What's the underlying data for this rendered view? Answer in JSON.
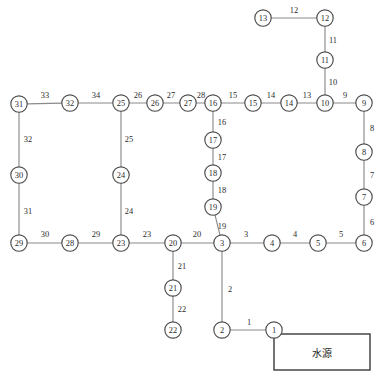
{
  "diagram": {
    "node_radius": 8.2,
    "colors": {
      "edge": "#8a8a8a",
      "node_stroke": "#4a4a4a",
      "node_fill": "#ffffff",
      "text": "#2b2b2b",
      "box_stroke": "#3a3a3a",
      "background": "#ffffff"
    },
    "source_box": {
      "label": "水源",
      "x": 274,
      "y": 334,
      "width": 96,
      "height": 36
    },
    "nodes": [
      {
        "id": "1",
        "label": "1",
        "x": 274,
        "y": 330
      },
      {
        "id": "2",
        "label": "2",
        "x": 222,
        "y": 330
      },
      {
        "id": "3",
        "label": "3",
        "x": 222,
        "y": 243
      },
      {
        "id": "4",
        "label": "4",
        "x": 272,
        "y": 243
      },
      {
        "id": "5",
        "label": "5",
        "x": 318,
        "y": 243
      },
      {
        "id": "6",
        "label": "6",
        "x": 364,
        "y": 243
      },
      {
        "id": "7",
        "label": "7",
        "x": 364,
        "y": 197
      },
      {
        "id": "8",
        "label": "8",
        "x": 364,
        "y": 152
      },
      {
        "id": "9",
        "label": "9",
        "x": 364,
        "y": 103
      },
      {
        "id": "10",
        "label": "10",
        "x": 325,
        "y": 103
      },
      {
        "id": "11",
        "label": "11",
        "x": 325,
        "y": 60
      },
      {
        "id": "12",
        "label": "12",
        "x": 325,
        "y": 18
      },
      {
        "id": "13",
        "label": "13",
        "x": 263,
        "y": 18
      },
      {
        "id": "14",
        "label": "14",
        "x": 289,
        "y": 103
      },
      {
        "id": "15",
        "label": "15",
        "x": 253,
        "y": 103
      },
      {
        "id": "16",
        "label": "16",
        "x": 213,
        "y": 103
      },
      {
        "id": "17",
        "label": "17",
        "x": 213,
        "y": 140
      },
      {
        "id": "18",
        "label": "18",
        "x": 213,
        "y": 173
      },
      {
        "id": "19",
        "label": "19",
        "x": 213,
        "y": 207
      },
      {
        "id": "20",
        "label": "20",
        "x": 173,
        "y": 243
      },
      {
        "id": "21",
        "label": "21",
        "x": 173,
        "y": 288
      },
      {
        "id": "22",
        "label": "22",
        "x": 173,
        "y": 330
      },
      {
        "id": "23",
        "label": "23",
        "x": 121,
        "y": 243
      },
      {
        "id": "24",
        "label": "24",
        "x": 121,
        "y": 175
      },
      {
        "id": "25",
        "label": "25",
        "x": 121,
        "y": 103
      },
      {
        "id": "26",
        "label": "26",
        "x": 155,
        "y": 103
      },
      {
        "id": "27",
        "label": "27",
        "x": 188,
        "y": 103
      },
      {
        "id": "28",
        "label": "28",
        "x": 70,
        "y": 243
      },
      {
        "id": "29",
        "label": "29",
        "x": 19,
        "y": 243
      },
      {
        "id": "30",
        "label": "30",
        "x": 19,
        "y": 175
      },
      {
        "id": "31",
        "label": "31",
        "x": 19,
        "y": 104
      },
      {
        "id": "32",
        "label": "32",
        "x": 70,
        "y": 103
      }
    ],
    "edges": [
      {
        "id": "e1",
        "from": "2",
        "to": "1",
        "label": "1",
        "lx": 249,
        "ly": 322
      },
      {
        "id": "e2",
        "from": "3",
        "to": "2",
        "label": "2",
        "lx": 230,
        "ly": 289
      },
      {
        "id": "e3",
        "from": "3",
        "to": "4",
        "label": "3",
        "lx": 246,
        "ly": 234
      },
      {
        "id": "e4",
        "from": "4",
        "to": "5",
        "label": "4",
        "lx": 295,
        "ly": 234
      },
      {
        "id": "e5",
        "from": "5",
        "to": "6",
        "label": "5",
        "lx": 341,
        "ly": 234
      },
      {
        "id": "e6",
        "from": "6",
        "to": "7",
        "label": "6",
        "lx": 372,
        "ly": 222
      },
      {
        "id": "e7",
        "from": "7",
        "to": "8",
        "label": "7",
        "lx": 372,
        "ly": 175
      },
      {
        "id": "e8",
        "from": "8",
        "to": "9",
        "label": "8",
        "lx": 372,
        "ly": 128
      },
      {
        "id": "e9",
        "from": "10",
        "to": "9",
        "label": "9",
        "lx": 345,
        "ly": 95
      },
      {
        "id": "e10",
        "from": "11",
        "to": "10",
        "label": "10",
        "lx": 333,
        "ly": 82
      },
      {
        "id": "e11",
        "from": "12",
        "to": "11",
        "label": "11",
        "lx": 333,
        "ly": 40
      },
      {
        "id": "e12",
        "from": "13",
        "to": "12",
        "label": "12",
        "lx": 294,
        "ly": 10
      },
      {
        "id": "e13",
        "from": "14",
        "to": "10",
        "label": "13",
        "lx": 307,
        "ly": 95
      },
      {
        "id": "e14",
        "from": "15",
        "to": "14",
        "label": "14",
        "lx": 271,
        "ly": 95
      },
      {
        "id": "e15",
        "from": "16",
        "to": "15",
        "label": "15",
        "lx": 233,
        "ly": 95
      },
      {
        "id": "e16",
        "from": "16",
        "to": "17",
        "label": "16",
        "lx": 222,
        "ly": 122
      },
      {
        "id": "e17",
        "from": "17",
        "to": "18",
        "label": "17",
        "lx": 222,
        "ly": 157
      },
      {
        "id": "e18",
        "from": "18",
        "to": "19",
        "label": "18",
        "lx": 222,
        "ly": 190
      },
      {
        "id": "e19",
        "from": "19",
        "to": "3",
        "label": "19",
        "lx": 222,
        "ly": 226
      },
      {
        "id": "e20",
        "from": "20",
        "to": "3",
        "label": "20",
        "lx": 197,
        "ly": 234
      },
      {
        "id": "e21",
        "from": "20",
        "to": "21",
        "label": "21",
        "lx": 182,
        "ly": 266
      },
      {
        "id": "e22",
        "from": "21",
        "to": "22",
        "label": "22",
        "lx": 182,
        "ly": 309
      },
      {
        "id": "e23",
        "from": "23",
        "to": "20",
        "label": "23",
        "lx": 147,
        "ly": 234
      },
      {
        "id": "e24",
        "from": "24",
        "to": "23",
        "label": "24",
        "lx": 129,
        "ly": 211
      },
      {
        "id": "e25",
        "from": "25",
        "to": "24",
        "label": "25",
        "lx": 129,
        "ly": 139
      },
      {
        "id": "e26",
        "from": "25",
        "to": "26",
        "label": "26",
        "lx": 138,
        "ly": 95
      },
      {
        "id": "e27",
        "from": "26",
        "to": "27",
        "label": "27",
        "lx": 171,
        "ly": 95
      },
      {
        "id": "e28",
        "from": "27",
        "to": "16",
        "label": "28",
        "lx": 201,
        "ly": 95
      },
      {
        "id": "e29",
        "from": "28",
        "to": "23",
        "label": "29",
        "lx": 96,
        "ly": 234
      },
      {
        "id": "e30",
        "from": "29",
        "to": "28",
        "label": "30",
        "lx": 45,
        "ly": 234
      },
      {
        "id": "e31",
        "from": "30",
        "to": "29",
        "label": "31",
        "lx": 28,
        "ly": 211
      },
      {
        "id": "e32",
        "from": "31",
        "to": "30",
        "label": "32",
        "lx": 28,
        "ly": 139
      },
      {
        "id": "e33",
        "from": "31",
        "to": "32",
        "label": "33",
        "lx": 45,
        "ly": 95
      },
      {
        "id": "e34",
        "from": "32",
        "to": "25",
        "label": "34",
        "lx": 96,
        "ly": 95
      }
    ]
  }
}
